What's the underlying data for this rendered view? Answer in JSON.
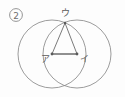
{
  "figure": {
    "item_number": "②",
    "background_color": "#fdfdfd",
    "stroke_color": "#8a8a8a",
    "heavy_stroke_color": "#6b6b6b",
    "label_color": "#5a5a5a",
    "labels": {
      "left_center": "ア",
      "right_center": "イ",
      "apex": "ウ"
    },
    "geometry": {
      "left_circle": {
        "cx": 52,
        "cy": 54,
        "r": 34
      },
      "right_circle": {
        "cx": 77,
        "cy": 54,
        "r": 34
      },
      "base_segment": {
        "x1": 52,
        "y1": 54,
        "x2": 77,
        "y2": 54
      },
      "apex_point": {
        "x": 65,
        "y": 23
      },
      "lower_intersection": {
        "x": 65,
        "y": 85
      }
    },
    "label_positions": {
      "item_number": {
        "x": 12,
        "y": 18
      },
      "apex": {
        "x": 61,
        "y": 16
      },
      "left_center": {
        "x": 41,
        "y": 62
      },
      "right_center": {
        "x": 81,
        "y": 62
      }
    }
  }
}
